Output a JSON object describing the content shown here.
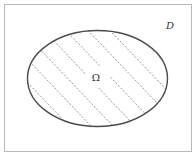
{
  "diagram": {
    "domain_label": "D",
    "region_label": "Ω",
    "colors": {
      "border": "#b8b8b8",
      "ellipse": "#4a4a4a",
      "hatch": "#8a8a8a",
      "text": "#333333"
    }
  }
}
